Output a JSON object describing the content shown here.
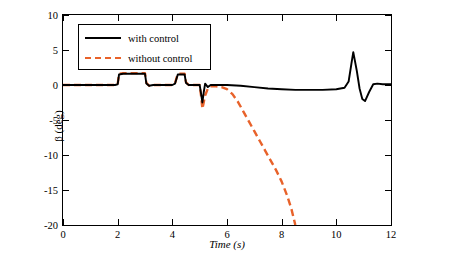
{
  "chart_data": {
    "type": "line",
    "title": "",
    "xlabel": "Time (s)",
    "ylabel": "β (deg)",
    "xlim": [
      0,
      12
    ],
    "ylim": [
      -20,
      10
    ],
    "xticks": [
      "0",
      "2",
      "4",
      "6",
      "8",
      "10",
      "12"
    ],
    "yticks": [
      "10",
      "5",
      "0",
      "-5",
      "-10",
      "-15",
      "-20"
    ],
    "grid": false,
    "legend_position": "top-left",
    "series": [
      {
        "name": "with control",
        "color": "#000000",
        "style": "solid",
        "points": [
          [
            0,
            0
          ],
          [
            0.5,
            0
          ],
          [
            1.0,
            0
          ],
          [
            1.5,
            0
          ],
          [
            1.9,
            0
          ],
          [
            2.0,
            0.1
          ],
          [
            2.05,
            1.5
          ],
          [
            2.2,
            1.6
          ],
          [
            2.5,
            1.6
          ],
          [
            2.8,
            1.6
          ],
          [
            3.0,
            1.6
          ],
          [
            3.05,
            0.2
          ],
          [
            3.15,
            -0.1
          ],
          [
            3.3,
            0
          ],
          [
            3.6,
            0
          ],
          [
            4.0,
            0
          ],
          [
            4.1,
            0.2
          ],
          [
            4.2,
            1.5
          ],
          [
            4.3,
            1.5
          ],
          [
            4.45,
            1.5
          ],
          [
            4.5,
            0.3
          ],
          [
            4.6,
            0
          ],
          [
            4.8,
            0
          ],
          [
            5.0,
            0
          ],
          [
            5.05,
            -1.2
          ],
          [
            5.1,
            -2.5
          ],
          [
            5.15,
            -1.0
          ],
          [
            5.2,
            0.2
          ],
          [
            5.3,
            -0.3
          ],
          [
            5.4,
            0
          ],
          [
            5.6,
            0
          ],
          [
            6.0,
            0
          ],
          [
            6.5,
            -0.1
          ],
          [
            7.0,
            -0.3
          ],
          [
            7.5,
            -0.5
          ],
          [
            8.0,
            -0.6
          ],
          [
            8.5,
            -0.7
          ],
          [
            9.0,
            -0.7
          ],
          [
            9.5,
            -0.7
          ],
          [
            10.0,
            -0.6
          ],
          [
            10.3,
            -0.4
          ],
          [
            10.45,
            0.5
          ],
          [
            10.55,
            3.0
          ],
          [
            10.62,
            4.7
          ],
          [
            10.75,
            2.0
          ],
          [
            10.85,
            -0.5
          ],
          [
            10.95,
            -2.0
          ],
          [
            11.05,
            -2.3
          ],
          [
            11.2,
            -1.0
          ],
          [
            11.35,
            0.1
          ],
          [
            11.5,
            0.2
          ],
          [
            11.7,
            0.1
          ],
          [
            12.0,
            0.1
          ]
        ]
      },
      {
        "name": "without control",
        "color": "#E8622A",
        "style": "dashed",
        "points": [
          [
            0,
            0
          ],
          [
            0.5,
            0
          ],
          [
            1.0,
            0
          ],
          [
            1.5,
            0
          ],
          [
            1.9,
            0
          ],
          [
            2.0,
            0.1
          ],
          [
            2.05,
            1.6
          ],
          [
            2.2,
            1.7
          ],
          [
            2.5,
            1.7
          ],
          [
            2.8,
            1.7
          ],
          [
            3.0,
            1.7
          ],
          [
            3.05,
            0.3
          ],
          [
            3.15,
            -0.1
          ],
          [
            3.3,
            0
          ],
          [
            3.6,
            0
          ],
          [
            4.0,
            0
          ],
          [
            4.1,
            0.3
          ],
          [
            4.2,
            1.6
          ],
          [
            4.3,
            1.6
          ],
          [
            4.45,
            1.6
          ],
          [
            4.5,
            0.4
          ],
          [
            4.6,
            0
          ],
          [
            4.8,
            0
          ],
          [
            5.0,
            0
          ],
          [
            5.05,
            -1.5
          ],
          [
            5.1,
            -3.4
          ],
          [
            5.2,
            -1.5
          ],
          [
            5.3,
            -0.5
          ],
          [
            5.4,
            -0.2
          ],
          [
            5.6,
            -0.2
          ],
          [
            5.8,
            -0.3
          ],
          [
            6.0,
            -0.6
          ],
          [
            6.2,
            -1.3
          ],
          [
            6.4,
            -2.4
          ],
          [
            6.6,
            -3.8
          ],
          [
            6.8,
            -5.2
          ],
          [
            7.0,
            -6.6
          ],
          [
            7.2,
            -8.0
          ],
          [
            7.4,
            -9.4
          ],
          [
            7.6,
            -10.8
          ],
          [
            7.8,
            -12.2
          ],
          [
            8.0,
            -13.8
          ],
          [
            8.2,
            -15.8
          ],
          [
            8.35,
            -17.6
          ],
          [
            8.45,
            -19.2
          ],
          [
            8.5,
            -20.0
          ]
        ]
      }
    ]
  },
  "legend": {
    "items": [
      {
        "label": "with control"
      },
      {
        "label": "without control"
      }
    ]
  }
}
